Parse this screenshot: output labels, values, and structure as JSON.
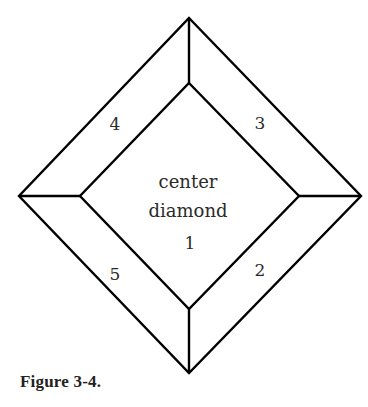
{
  "figure": {
    "caption": "Figure 3-4.",
    "center_label_line1": "center",
    "center_label_line2": "diamond",
    "pieces": [
      {
        "id": "1",
        "label": "1",
        "position": "center"
      },
      {
        "id": "2",
        "label": "2",
        "position": "lower-right"
      },
      {
        "id": "3",
        "label": "3",
        "position": "upper-right"
      },
      {
        "id": "4",
        "label": "4",
        "position": "upper-left"
      },
      {
        "id": "5",
        "label": "5",
        "position": "lower-left"
      }
    ],
    "colors": {
      "line": "#000000",
      "text": "#2a2a2a",
      "background": "#ffffff"
    }
  }
}
